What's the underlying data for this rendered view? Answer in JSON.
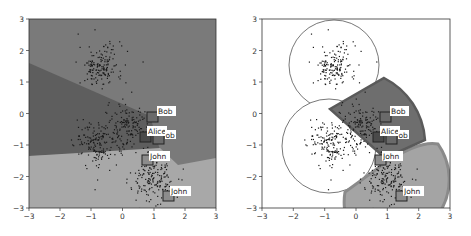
{
  "chart_data": [
    {
      "type": "scatter",
      "title": "",
      "xlabel": "",
      "ylabel": "",
      "xlim": [
        -3,
        3
      ],
      "ylim": [
        -3,
        3
      ],
      "x_ticks": [
        "-3",
        "-2",
        "-1",
        "0",
        "1",
        "2",
        "3"
      ],
      "y_ticks": [
        "3",
        "2",
        "1",
        "0",
        "-1",
        "-2",
        "-3"
      ],
      "grid": false,
      "background_regions": [
        {
          "name": "upper region",
          "color": "#7a7a7a"
        },
        {
          "name": "middle-left region",
          "color": "#5e5e5e"
        },
        {
          "name": "lower region",
          "color": "#a8a8a8"
        }
      ],
      "clusters": [
        {
          "center": [
            -0.7,
            1.5
          ],
          "spread": 0.35
        },
        {
          "center": [
            0.2,
            -0.4
          ],
          "spread": 0.35
        },
        {
          "center": [
            -0.8,
            -1.0
          ],
          "spread": 0.35
        },
        {
          "center": [
            1.0,
            -2.1
          ],
          "spread": 0.35
        }
      ],
      "markers": [
        {
          "label": "Bob",
          "x": 1.05,
          "y": -0.1,
          "fill": "#6a6a6a"
        },
        {
          "label": "Alice",
          "x": 0.7,
          "y": -0.75,
          "fill": "#4a4a4a"
        },
        {
          "label": "ob",
          "x": 1.15,
          "y": -0.85,
          "fill": "#6a6a6a"
        },
        {
          "label": "John",
          "x": 0.8,
          "y": -1.5,
          "fill": "#8c8c8c"
        },
        {
          "label": "John",
          "x": 1.5,
          "y": -2.6,
          "fill": "#8c8c8c"
        }
      ]
    },
    {
      "type": "scatter",
      "title": "",
      "xlabel": "",
      "ylabel": "",
      "xlim": [
        -3,
        3
      ],
      "ylim": [
        -3,
        3
      ],
      "x_ticks": [
        "-3",
        "-2",
        "-1",
        "0",
        "1",
        "2",
        "3"
      ],
      "y_ticks": [
        "3",
        "2",
        "1",
        "0",
        "-1",
        "-2",
        "-3"
      ],
      "grid": false,
      "cells": [
        {
          "name": "top-left circle",
          "color": "#ffffff"
        },
        {
          "name": "middle-left circle",
          "color": "#ffffff"
        },
        {
          "name": "center sector",
          "color": "#6e6e6e"
        },
        {
          "name": "lower-right sector",
          "color": "#a4a4a4"
        }
      ],
      "markers": [
        {
          "label": "Bob",
          "x": 1.05,
          "y": -0.1
        },
        {
          "label": "Alice",
          "x": 0.7,
          "y": -0.75
        },
        {
          "label": "ob",
          "x": 1.15,
          "y": -0.85
        },
        {
          "label": "John",
          "x": 0.8,
          "y": -1.5
        },
        {
          "label": "John",
          "x": 1.5,
          "y": -2.6
        }
      ]
    }
  ],
  "labels": {
    "bob": "Bob",
    "alice": "Alice",
    "ob": "ob",
    "john": "John"
  },
  "ticks": {
    "xm3": "−3",
    "xm2": "−2",
    "xm1": "−1",
    "x0": "0",
    "x1": "1",
    "x2": "2",
    "x3": "3",
    "y3": "3",
    "y2": "2",
    "y1": "1",
    "y0": "0",
    "ym1": "−1",
    "ym2": "−2",
    "ym3": "−3"
  }
}
